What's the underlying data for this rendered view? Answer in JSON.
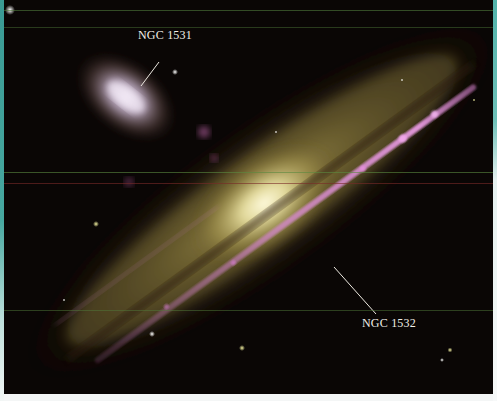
{
  "image": {
    "subject": "Interacting galaxies NGC 1531 and NGC 1532",
    "labels": [
      {
        "text": "NGC 1531",
        "x": 134,
        "y": 28
      },
      {
        "text": "NGC 1532",
        "x": 362,
        "y": 316
      }
    ],
    "colors": {
      "background": "#0a0605",
      "border_left": "#3a9a94",
      "border_right": "#52b3ab",
      "label_text": "#f2efe8",
      "spiral_arm": "#d77fcf",
      "bulge": "#f3f0c8",
      "halo": "#8c7a3a",
      "elliptical_core": "#e9dcf0"
    }
  }
}
